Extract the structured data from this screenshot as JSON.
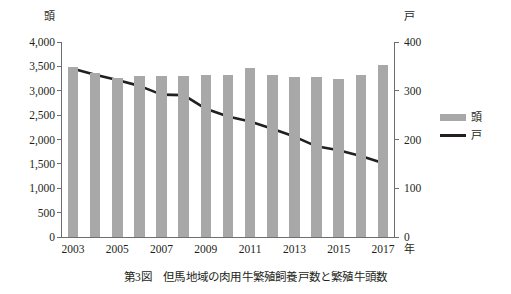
{
  "caption": "第3図　但馬地域の肉用牛繁殖飼養戸数と繁殖牛頭数",
  "axes": {
    "left_unit": "頭",
    "right_unit": "戸",
    "x_unit": "年"
  },
  "legend": {
    "items": [
      {
        "label": "頭",
        "marker": "bar-swatch",
        "color": "#a8a8a8"
      },
      {
        "label": "戸",
        "marker": "line-swatch",
        "color": "#231f20"
      }
    ]
  },
  "chart_data": {
    "type": "bar",
    "title": "第3図　但馬地域の肉用牛繁殖飼養戸数と繁殖牛頭数",
    "xlabel": "年",
    "ylabel": "頭",
    "y2label": "戸",
    "grid": false,
    "legend_position": "right",
    "categories": [
      "2003",
      "2004",
      "2005",
      "2006",
      "2007",
      "2008",
      "2009",
      "2010",
      "2011",
      "2012",
      "2013",
      "2014",
      "2015",
      "2016",
      "2017"
    ],
    "x_tick_labels": [
      "2003",
      "2005",
      "2007",
      "2009",
      "2011",
      "2013",
      "2015",
      "2017"
    ],
    "y_tick_labels": [
      "0",
      "500",
      "1,000",
      "1,500",
      "2,000",
      "2,500",
      "3,000",
      "3,500",
      "4,000"
    ],
    "y2_tick_labels": [
      "0",
      "100",
      "200",
      "300",
      "400"
    ],
    "ylim": [
      0,
      4000
    ],
    "y2lim": [
      0,
      400
    ],
    "series": [
      {
        "name": "頭",
        "type": "bar",
        "axis": "left",
        "color": "#a8a8a8",
        "values": [
          3480,
          3370,
          3270,
          3310,
          3300,
          3300,
          3320,
          3320,
          3460,
          3330,
          3290,
          3280,
          3240,
          3320,
          3520
        ]
      },
      {
        "name": "戸",
        "type": "line",
        "axis": "right",
        "color": "#231f20",
        "values": [
          345,
          333,
          322,
          310,
          292,
          291,
          263,
          247,
          237,
          222,
          206,
          186,
          178,
          166,
          152
        ]
      }
    ]
  }
}
